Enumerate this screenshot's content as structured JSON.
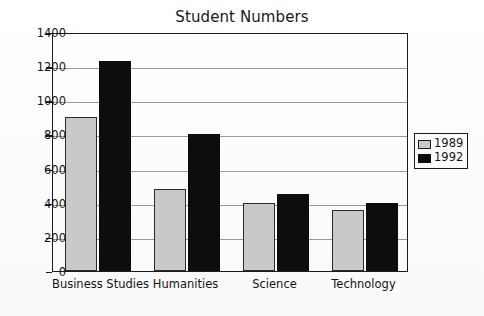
{
  "chart_data": {
    "type": "bar",
    "title": "Student Numbers",
    "xlabel": "",
    "ylabel": "",
    "ylim": [
      0,
      1400
    ],
    "ytick_step": 200,
    "yticks": [
      "0",
      "200",
      "400",
      "600",
      "800",
      "1000",
      "1200",
      "1400"
    ],
    "grid": true,
    "legend_position": "right",
    "categories": [
      "Business Studies",
      "Humanities",
      "Science",
      "Technology"
    ],
    "series": [
      {
        "name": "1989",
        "color": "#c9c9c9",
        "values": [
          900,
          480,
          400,
          355
        ]
      },
      {
        "name": "1992",
        "color": "#0d0d0f",
        "values": [
          1230,
          800,
          450,
          400
        ]
      }
    ]
  },
  "legend": {
    "entries": [
      {
        "label": "1989",
        "swatch": "light-gray-swatch"
      },
      {
        "label": "1992",
        "swatch": "black-swatch"
      }
    ]
  }
}
